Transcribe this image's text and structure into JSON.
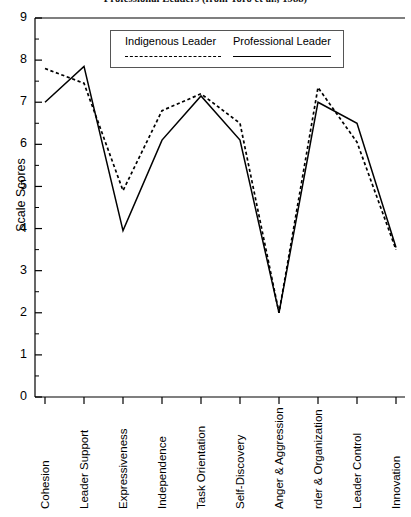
{
  "chart_data": {
    "type": "line",
    "title": "Professional Leaders (from Toro et al., 1988)",
    "xlabel": "",
    "ylabel": "Scale Scores",
    "ylim": [
      0,
      9
    ],
    "ytick_labels": [
      "0",
      "1",
      "2",
      "3",
      "4",
      "5",
      "6",
      "7",
      "8",
      "9"
    ],
    "yticks": [
      0,
      1,
      2,
      3,
      4,
      5,
      6,
      7,
      8,
      9
    ],
    "grid": false,
    "legend_position": "top-center",
    "categories": [
      "Cohesion",
      "Leader Support",
      "Expressiveness",
      "Independence",
      "Task Orientation",
      "Self-Discovery",
      "Anger & Aggression",
      "rder & Organization",
      "Leader Control",
      "Innovation"
    ],
    "series": [
      {
        "name": "Indigenous Leader",
        "style": "dashed",
        "color": "#000000",
        "values": [
          7.8,
          7.45,
          4.9,
          6.8,
          7.2,
          6.5,
          2.0,
          7.35,
          6.05,
          3.5
        ]
      },
      {
        "name": "Professional Leader",
        "style": "solid",
        "color": "#000000",
        "values": [
          7.0,
          7.85,
          3.95,
          6.1,
          7.15,
          6.1,
          2.0,
          7.0,
          6.5,
          3.55
        ]
      }
    ]
  },
  "legend": {
    "indigenous_label": "Indigenous Leader",
    "professional_label": "Professional Leader"
  },
  "axes": {
    "y_title": "Scale Scores"
  }
}
